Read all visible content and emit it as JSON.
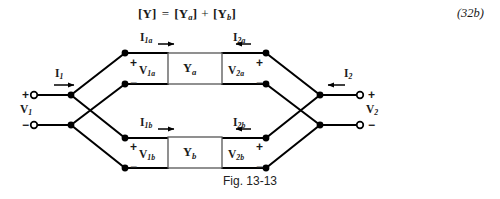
{
  "equation": {
    "lhs": "[Y]",
    "eq": "=",
    "term_a": "[Y",
    "sub_a": "a",
    "term_a_close": "]",
    "plus": "+",
    "term_b": "[Y",
    "sub_b": "b",
    "term_b_close": "]",
    "number": "(32b)"
  },
  "circuit": {
    "blocks": [
      {
        "name": "block-ya",
        "symbol": "Y",
        "subscript": "a"
      },
      {
        "name": "block-yb",
        "symbol": "Y",
        "subscript": "b"
      }
    ],
    "port_labels": {
      "i1": "I",
      "i1_sub": "1",
      "v1": "V",
      "v1_sub": "1",
      "i2": "I",
      "i2_sub": "2",
      "v2": "V",
      "v2_sub": "2",
      "i1a": "I",
      "i1a_sub": "1a",
      "v1a": "V",
      "v1a_sub": "1a",
      "i2a": "I",
      "i2a_sub": "2a",
      "v2a": "V",
      "v2a_sub": "2a",
      "i1b": "I",
      "i1b_sub": "1b",
      "v1b": "V",
      "v1b_sub": "1b",
      "i2b": "I",
      "i2b_sub": "2b",
      "v2b": "V",
      "v2b_sub": "2b"
    },
    "polarity": {
      "plus": "+",
      "minus": "−"
    },
    "colors": {
      "wire": "#000000",
      "node": "#000000",
      "terminal_fill": "#ffffff",
      "block_fill": "#ffffff",
      "block_stroke": "#555555",
      "background": "#ffffff"
    }
  },
  "caption": {
    "text": "Fig. 13-13"
  }
}
